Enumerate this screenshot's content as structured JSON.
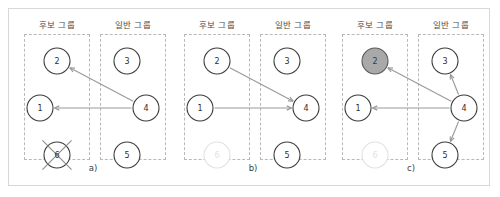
{
  "figure": {
    "groups": {
      "candidate_label": "후보 그룹",
      "general_label": "일반 그룹"
    },
    "colors": {
      "node_stroke": "#3c3c3c",
      "node_fill": "#ffffff",
      "selected_fill": "#a9a9a9",
      "faded_stroke": "#e2e2e2",
      "edge": "#9a9a9a",
      "group_box_border": "#b9b9b9",
      "frame_border": "#d8d8d8"
    },
    "panels": [
      {
        "id": "a",
        "caption": "a)",
        "candidate_header": "후보 그룹",
        "general_header": "일반 그룹",
        "nodes": [
          {
            "id": "n2",
            "label": "2",
            "group": "candidate",
            "cx": 44,
            "cy": 52,
            "r": 13,
            "state": "normal"
          },
          {
            "id": "n1",
            "label": "1",
            "group": "candidate",
            "cx": 27,
            "cy": 99,
            "r": 13,
            "state": "normal"
          },
          {
            "id": "n6",
            "label": "6",
            "group": "candidate",
            "cx": 44,
            "cy": 146,
            "r": 13,
            "state": "crossed"
          },
          {
            "id": "n3",
            "label": "3",
            "group": "general",
            "cx": 114,
            "cy": 52,
            "r": 13,
            "state": "normal"
          },
          {
            "id": "n4",
            "label": "4",
            "group": "general",
            "cx": 133,
            "cy": 99,
            "r": 13,
            "state": "normal"
          },
          {
            "id": "n5",
            "label": "5",
            "group": "general",
            "cx": 114,
            "cy": 146,
            "r": 13,
            "state": "normal"
          }
        ],
        "edges": [
          {
            "from": "n4",
            "to": "n2",
            "direction": "4->2"
          },
          {
            "from": "n4",
            "to": "n1",
            "direction": "4->1"
          }
        ]
      },
      {
        "id": "b",
        "caption": "b)",
        "candidate_header": "후보 그룹",
        "general_header": "일반 그룹",
        "nodes": [
          {
            "id": "n2",
            "label": "2",
            "group": "candidate",
            "cx": 44,
            "cy": 52,
            "r": 13,
            "state": "normal"
          },
          {
            "id": "n1",
            "label": "1",
            "group": "candidate",
            "cx": 27,
            "cy": 99,
            "r": 13,
            "state": "normal"
          },
          {
            "id": "n6",
            "label": "6",
            "group": "candidate",
            "cx": 44,
            "cy": 146,
            "r": 13,
            "state": "faded"
          },
          {
            "id": "n3",
            "label": "3",
            "group": "general",
            "cx": 114,
            "cy": 52,
            "r": 13,
            "state": "normal"
          },
          {
            "id": "n4",
            "label": "4",
            "group": "general",
            "cx": 133,
            "cy": 99,
            "r": 13,
            "state": "normal"
          },
          {
            "id": "n5",
            "label": "5",
            "group": "general",
            "cx": 114,
            "cy": 146,
            "r": 13,
            "state": "normal"
          }
        ],
        "edges": [
          {
            "from": "n2",
            "to": "n4",
            "direction": "2->4"
          },
          {
            "from": "n1",
            "to": "n4",
            "direction": "1->4"
          }
        ]
      },
      {
        "id": "c",
        "caption": "c)",
        "candidate_header": "후보 그룹",
        "general_header": "일반 그룹",
        "nodes": [
          {
            "id": "n2",
            "label": "2",
            "group": "candidate",
            "cx": 44,
            "cy": 52,
            "r": 13,
            "state": "selected"
          },
          {
            "id": "n1",
            "label": "1",
            "group": "candidate",
            "cx": 27,
            "cy": 99,
            "r": 13,
            "state": "normal"
          },
          {
            "id": "n6",
            "label": "6",
            "group": "candidate",
            "cx": 44,
            "cy": 146,
            "r": 13,
            "state": "faded"
          },
          {
            "id": "n3",
            "label": "3",
            "group": "general",
            "cx": 114,
            "cy": 52,
            "r": 13,
            "state": "normal"
          },
          {
            "id": "n4",
            "label": "4",
            "group": "general",
            "cx": 133,
            "cy": 99,
            "r": 13,
            "state": "normal"
          },
          {
            "id": "n5",
            "label": "5",
            "group": "general",
            "cx": 114,
            "cy": 146,
            "r": 13,
            "state": "normal"
          }
        ],
        "edges": [
          {
            "from": "n4",
            "to": "n2",
            "direction": "4->2"
          },
          {
            "from": "n4",
            "to": "n1",
            "direction": "4->1"
          },
          {
            "from": "n4",
            "to": "n3",
            "direction": "4->3"
          },
          {
            "from": "n4",
            "to": "n5",
            "direction": "4->5"
          }
        ]
      }
    ]
  }
}
